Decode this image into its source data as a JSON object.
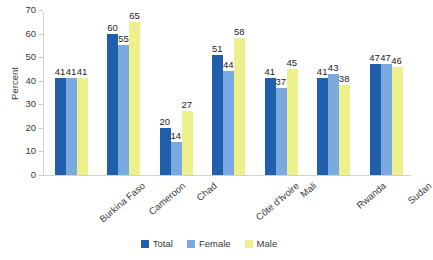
{
  "chart_data": {
    "type": "bar",
    "title": "",
    "xlabel": "",
    "ylabel": "Percent",
    "ylim": [
      0,
      70
    ],
    "ytick_step": 10,
    "yticks": [
      70,
      60,
      50,
      40,
      30,
      20,
      10,
      0
    ],
    "grid": false,
    "legend_position": "bottom-center",
    "categories": [
      "Burkina Faso",
      "Cameroon",
      "Chad",
      "Côte d'Ivoire",
      "Mali",
      "Rwanda",
      "Sudan"
    ],
    "series": [
      {
        "name": "Total",
        "color": "#1f5fab",
        "values": [
          41,
          60,
          20,
          51,
          41,
          41,
          47
        ]
      },
      {
        "name": "Female",
        "color": "#7aa9e0",
        "values": [
          41,
          55,
          14,
          44,
          37,
          43,
          47
        ]
      },
      {
        "name": "Male",
        "color": "#eef08c",
        "values": [
          41,
          65,
          27,
          58,
          45,
          38,
          46
        ]
      }
    ]
  },
  "artifact": {
    "top_text": ""
  }
}
